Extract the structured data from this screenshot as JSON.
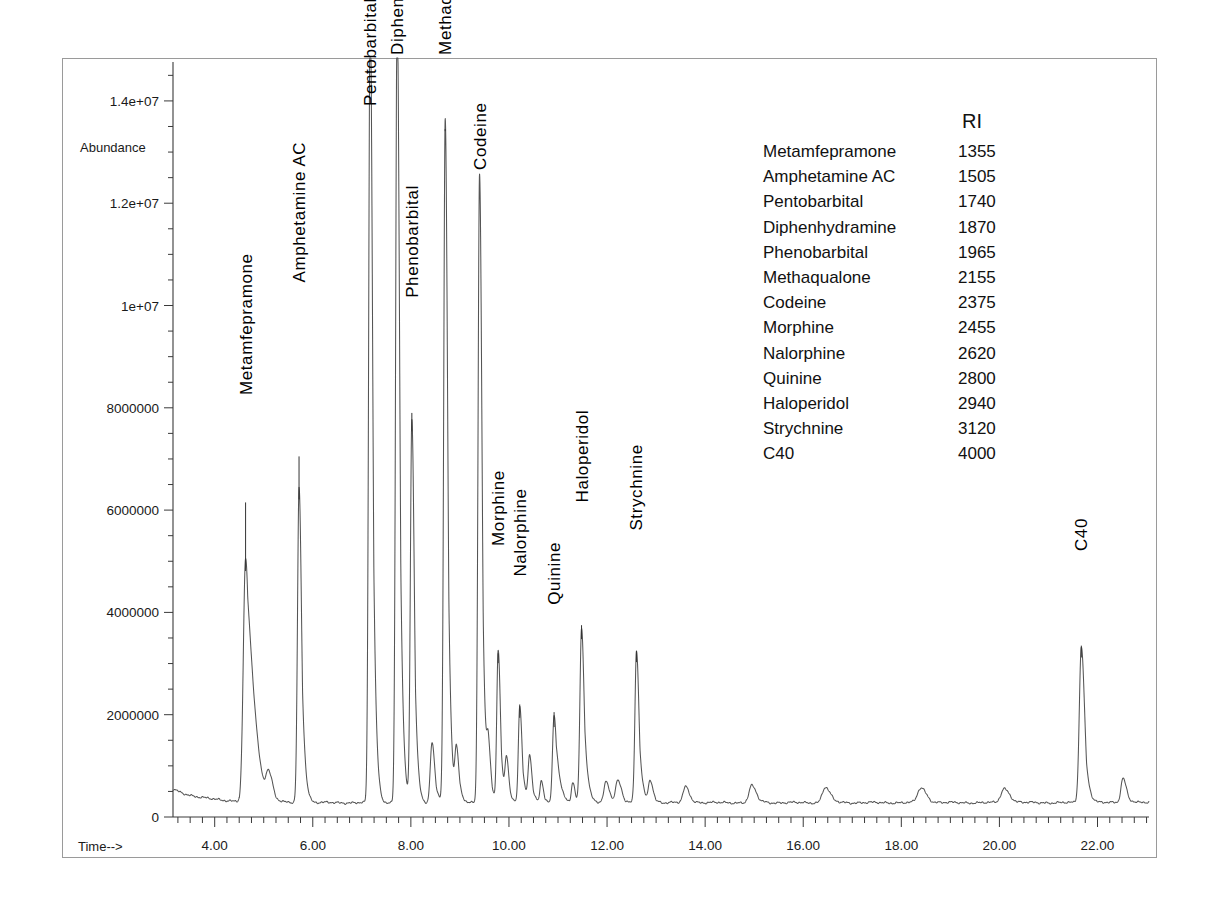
{
  "figure": {
    "kind": "gc-ms-chromatogram",
    "axis_labels": {
      "y_title": "Abundance",
      "x_title": "Time-->"
    }
  },
  "legend": {
    "header_name": "",
    "header_ri": "RI",
    "rows": [
      {
        "name": "Metamfepramone",
        "ri": "1355"
      },
      {
        "name": "Amphetamine AC",
        "ri": "1505"
      },
      {
        "name": "Pentobarbital",
        "ri": "1740"
      },
      {
        "name": "Diphenhydramine",
        "ri": "1870"
      },
      {
        "name": "Phenobarbital",
        "ri": "1965"
      },
      {
        "name": "Methaqualone",
        "ri": "2155"
      },
      {
        "name": "Codeine",
        "ri": "2375"
      },
      {
        "name": "Morphine",
        "ri": "2455"
      },
      {
        "name": "Nalorphine",
        "ri": "2620"
      },
      {
        "name": "Quinine",
        "ri": "2800"
      },
      {
        "name": "Haloperidol",
        "ri": "2940"
      },
      {
        "name": "Strychnine",
        "ri": "3120"
      },
      {
        "name": "C40",
        "ri": "4000"
      }
    ]
  },
  "chart_data": {
    "type": "line",
    "title": "",
    "subtitle": "",
    "xlabel": "Time-->",
    "ylabel": "Abundance",
    "xlim": [
      3.15,
      23.05
    ],
    "ylim": [
      0,
      14800000
    ],
    "grid": false,
    "legend_position": "inset-top-right",
    "x_ticks_major": [
      4.0,
      6.0,
      8.0,
      10.0,
      12.0,
      14.0,
      16.0,
      18.0,
      20.0,
      22.0
    ],
    "x_tick_labels": [
      "4.00",
      "6.00",
      "8.00",
      "10.00",
      "12.00",
      "14.00",
      "16.00",
      "18.00",
      "20.00",
      "22.00"
    ],
    "x_minor_step": 0.25,
    "y_ticks_major": [
      0,
      2000000,
      4000000,
      6000000,
      8000000,
      10000000,
      12000000,
      14000000
    ],
    "y_tick_labels": [
      "0",
      "2000000",
      "4000000",
      "6000000",
      "8000000",
      "1e+07",
      "1.2e+07",
      "1.4e+07"
    ],
    "y_minor_step": 500000,
    "baseline_level": 280000,
    "clip_note": "Several peaks are clipped by the top of the plot frame",
    "peaks": [
      {
        "label": "Metamfepramone",
        "rt": 4.63,
        "height": 4750000,
        "width": 0.075,
        "tail": 0.34,
        "labeled": true,
        "label_y": 8250000,
        "leader_top": 6150000
      },
      {
        "label": "",
        "rt": 5.1,
        "height": 520000,
        "width": 0.085,
        "tail": 0.1,
        "labeled": false
      },
      {
        "label": "Amphetamine AC",
        "rt": 5.72,
        "height": 6150000,
        "width": 0.05,
        "tail": 0.08,
        "labeled": true,
        "label_y": 10450000,
        "leader_top": 7050000
      },
      {
        "label": "Pentobarbital",
        "rt": 7.17,
        "height": 15600000,
        "width": 0.048,
        "tail": 0.07,
        "labeled": true,
        "label_y": 13900000,
        "leader_top": 11900000
      },
      {
        "label": "Phenobarbital",
        "rt": 8.02,
        "height": 7480000,
        "width": 0.048,
        "tail": 0.07,
        "labeled": true,
        "label_y": 10150000,
        "leader_top": 7900000
      },
      {
        "label": "Diphenhydramine",
        "rt": 7.72,
        "height": 15600000,
        "width": 0.048,
        "tail": 0.07,
        "labeled": true,
        "label_y": 14900000,
        "leader_top": 13200000
      },
      {
        "label": "",
        "rt": 8.43,
        "height": 1170000,
        "width": 0.055,
        "tail": 0.08,
        "labeled": false
      },
      {
        "label": "Methaqualone",
        "rt": 8.7,
        "height": 13350000,
        "width": 0.048,
        "tail": 0.07,
        "labeled": true,
        "label_y": 14900000,
        "leader_top": 13450000
      },
      {
        "label": "",
        "rt": 8.93,
        "height": 1000000,
        "width": 0.05,
        "tail": 0.08,
        "labeled": false
      },
      {
        "label": "Codeine",
        "rt": 9.4,
        "height": 12300000,
        "width": 0.048,
        "tail": 0.07,
        "labeled": true,
        "label_y": 12650000,
        "leader_top": 11000000
      },
      {
        "label": "",
        "rt": 9.58,
        "height": 940000,
        "width": 0.05,
        "tail": 0.07,
        "labeled": false
      },
      {
        "label": "Morphine",
        "rt": 9.78,
        "height": 2950000,
        "width": 0.046,
        "tail": 0.07,
        "labeled": true,
        "label_y": 5300000,
        "leader_top": 3200000
      },
      {
        "label": "",
        "rt": 9.95,
        "height": 830000,
        "width": 0.046,
        "tail": 0.06,
        "labeled": false
      },
      {
        "label": "Nalorphine",
        "rt": 10.22,
        "height": 1880000,
        "width": 0.046,
        "tail": 0.07,
        "labeled": true,
        "label_y": 4700000,
        "leader_top": 2200000
      },
      {
        "label": "",
        "rt": 10.42,
        "height": 900000,
        "width": 0.048,
        "tail": 0.07,
        "labeled": false
      },
      {
        "label": "",
        "rt": 10.66,
        "height": 420000,
        "width": 0.045,
        "tail": 0.06,
        "labeled": false
      },
      {
        "label": "Quinine",
        "rt": 10.92,
        "height": 1700000,
        "width": 0.05,
        "tail": 0.13,
        "labeled": true,
        "label_y": 4150000,
        "leader_top": 2050000
      },
      {
        "label": "",
        "rt": 11.3,
        "height": 400000,
        "width": 0.045,
        "tail": 0.06,
        "labeled": false
      },
      {
        "label": "Haloperidol",
        "rt": 11.48,
        "height": 3420000,
        "width": 0.052,
        "tail": 0.09,
        "labeled": true,
        "label_y": 6150000,
        "leader_top": 3750000
      },
      {
        "label": "",
        "rt": 11.98,
        "height": 400000,
        "width": 0.07,
        "tail": 0.08,
        "labeled": false
      },
      {
        "label": "",
        "rt": 12.22,
        "height": 430000,
        "width": 0.075,
        "tail": 0.08,
        "labeled": false
      },
      {
        "label": "Strychnine",
        "rt": 12.6,
        "height": 2970000,
        "width": 0.05,
        "tail": 0.08,
        "labeled": true,
        "label_y": 5600000,
        "leader_top": 3250000
      },
      {
        "label": "",
        "rt": 12.88,
        "height": 430000,
        "width": 0.06,
        "tail": 0.07,
        "labeled": false
      },
      {
        "label": "",
        "rt": 13.6,
        "height": 310000,
        "width": 0.08,
        "tail": 0.09,
        "labeled": false
      },
      {
        "label": "",
        "rt": 14.95,
        "height": 330000,
        "width": 0.09,
        "tail": 0.1,
        "labeled": false
      },
      {
        "label": "",
        "rt": 16.45,
        "height": 300000,
        "width": 0.1,
        "tail": 0.11,
        "labeled": false
      },
      {
        "label": "",
        "rt": 18.4,
        "height": 290000,
        "width": 0.11,
        "tail": 0.11,
        "labeled": false
      },
      {
        "label": "",
        "rt": 20.1,
        "height": 275000,
        "width": 0.11,
        "tail": 0.11,
        "labeled": false
      },
      {
        "label": "C40",
        "rt": 21.67,
        "height": 3060000,
        "width": 0.065,
        "tail": 0.09,
        "labeled": true,
        "label_y": 5200000,
        "leader_top": 3350000
      },
      {
        "label": "",
        "rt": 22.52,
        "height": 480000,
        "width": 0.07,
        "tail": 0.09,
        "labeled": false
      }
    ]
  }
}
